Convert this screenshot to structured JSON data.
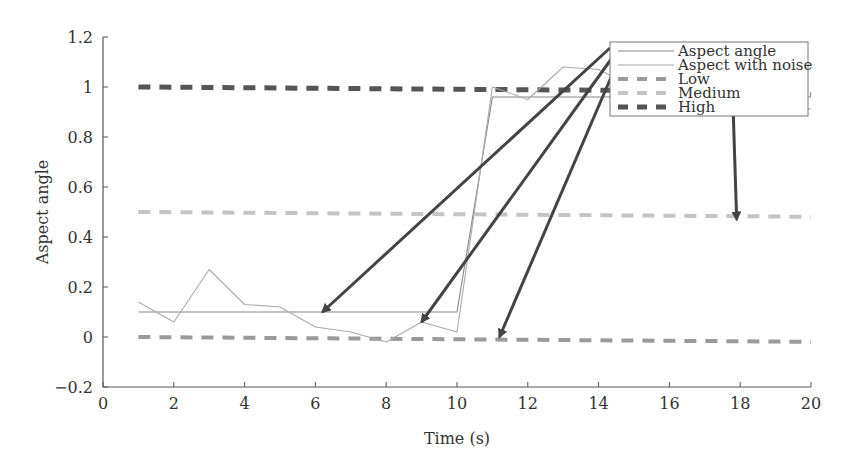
{
  "chart_data": {
    "type": "line",
    "title": "",
    "xlabel": "Time (s)",
    "ylabel": "Aspect angle",
    "xlim": [
      0,
      20
    ],
    "ylim": [
      -0.2,
      1.2
    ],
    "xticks": [
      0,
      2,
      4,
      6,
      8,
      10,
      12,
      14,
      16,
      18,
      20
    ],
    "xtick_labels": [
      "0",
      "2",
      "4",
      "6",
      "8",
      "10",
      "12",
      "14",
      "16",
      "18",
      "20"
    ],
    "yticks": [
      -0.2,
      0,
      0.2,
      0.4,
      0.6,
      0.8,
      1,
      1.2
    ],
    "ytick_labels": [
      "−0.2",
      "0",
      "0.2",
      "0.4",
      "0.6",
      "0.8",
      "1",
      "1.2"
    ],
    "grid": false,
    "legend_position": "upper right",
    "x": [
      1,
      2,
      3,
      4,
      5,
      6,
      7,
      8,
      9,
      10,
      11,
      12,
      13,
      14,
      15,
      16,
      17,
      18,
      19,
      20
    ],
    "series": [
      {
        "name": "Aspect angle",
        "style": "solid-thin",
        "color": "#888888",
        "values": [
          0.1,
          0.1,
          0.1,
          0.1,
          0.1,
          0.1,
          0.1,
          0.1,
          0.1,
          0.1,
          0.96,
          0.96,
          0.96,
          0.96,
          0.96,
          0.96,
          0.96,
          0.96,
          0.96,
          0.96
        ]
      },
      {
        "name": "Aspect with noise",
        "style": "solid-thin",
        "color": "#aaaaaa",
        "values": [
          0.14,
          0.06,
          0.27,
          0.13,
          0.12,
          0.04,
          0.02,
          -0.02,
          0.06,
          0.02,
          1.0,
          0.95,
          1.08,
          1.07,
          1.0,
          0.98,
          0.97,
          0.96,
          0.96,
          0.91
        ]
      },
      {
        "name": "Low",
        "style": "dashed",
        "color": "#9a9a9a",
        "values": [
          0.0,
          -0.001,
          -0.002,
          -0.003,
          -0.004,
          -0.005,
          -0.006,
          -0.007,
          -0.008,
          -0.009,
          -0.01,
          -0.011,
          -0.012,
          -0.013,
          -0.014,
          -0.015,
          -0.016,
          -0.017,
          -0.018,
          -0.02
        ]
      },
      {
        "name": "Medium",
        "style": "dashed",
        "color": "#c4c4c4",
        "values": [
          0.5,
          0.499,
          0.498,
          0.497,
          0.496,
          0.495,
          0.494,
          0.493,
          0.492,
          0.491,
          0.49,
          0.489,
          0.488,
          0.487,
          0.486,
          0.485,
          0.484,
          0.483,
          0.482,
          0.48
        ]
      },
      {
        "name": "High",
        "style": "dashed-thick",
        "color": "#555555",
        "values": [
          1.0,
          0.999,
          0.998,
          0.997,
          0.996,
          0.995,
          0.994,
          0.993,
          0.992,
          0.991,
          0.99,
          0.989,
          0.988,
          0.987,
          0.986,
          0.985,
          0.984,
          0.983,
          0.982,
          0.97
        ]
      }
    ],
    "annotations": [
      {
        "type": "arrow",
        "from": "legend:Aspect angle",
        "to": [
          6.2,
          0.1
        ]
      },
      {
        "type": "arrow",
        "from": "legend:Aspect with noise",
        "to": [
          9.0,
          0.06
        ]
      },
      {
        "type": "arrow",
        "from": "legend:Low",
        "to": [
          11.2,
          0.0
        ]
      },
      {
        "type": "arrow",
        "from": "legend:Medium",
        "to": [
          17.9,
          0.47
        ]
      }
    ]
  },
  "legend": {
    "items": [
      {
        "label": "Aspect angle"
      },
      {
        "label": "Aspect with noise"
      },
      {
        "label": "Low"
      },
      {
        "label": "Medium"
      },
      {
        "label": "High"
      }
    ]
  }
}
